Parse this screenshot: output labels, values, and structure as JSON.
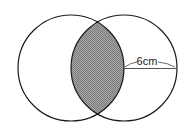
{
  "diagram": {
    "shapes": [
      {
        "type": "circle",
        "name": "left-circle",
        "cx": 71,
        "cy": 68,
        "r": 53
      },
      {
        "type": "circle",
        "name": "right-circle",
        "cx": 124,
        "cy": 68,
        "r": 53
      }
    ],
    "shaded_region": "intersection (lens) of the two circles",
    "radius_label": "6cm",
    "colors": {
      "stroke": "#1a1a1a",
      "shade": "#9a9a9a"
    }
  }
}
